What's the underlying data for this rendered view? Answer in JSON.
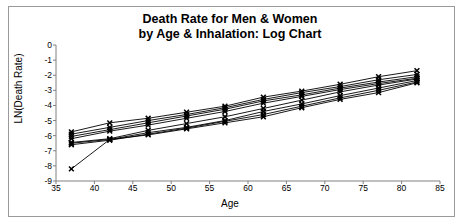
{
  "chart_data": {
    "type": "line",
    "title": "Death Rate for Men & Women by Age & Inhalation: Log Chart",
    "title_line1": "Death Rate for Men & Women",
    "title_line2": "by Age & Inhalation: Log Chart",
    "xlabel": "Age",
    "ylabel": "LN(Death Rate)",
    "xlim": [
      35,
      85
    ],
    "ylim": [
      -9,
      0
    ],
    "xticks": [
      35,
      40,
      45,
      50,
      55,
      60,
      65,
      70,
      75,
      80,
      85
    ],
    "yticks": [
      0,
      -1,
      -2,
      -3,
      -4,
      -5,
      -6,
      -7,
      -8,
      -9
    ],
    "grid": false,
    "legend": "none",
    "marker": "x-cross",
    "line_color": "#000000",
    "x": [
      37,
      42,
      47,
      52,
      57,
      62,
      67,
      72,
      77,
      82
    ],
    "series": [
      {
        "name": "series-1",
        "values": [
          -5.75,
          -5.15,
          -4.85,
          -4.45,
          -4.05,
          -3.45,
          -3.05,
          -2.6,
          -2.1,
          -1.7
        ]
      },
      {
        "name": "series-2",
        "values": [
          -5.9,
          -5.45,
          -5.0,
          -4.6,
          -4.15,
          -3.6,
          -3.15,
          -2.75,
          -2.3,
          -1.95
        ]
      },
      {
        "name": "series-3",
        "values": [
          -6.05,
          -5.6,
          -5.15,
          -4.7,
          -4.25,
          -3.7,
          -3.3,
          -2.85,
          -2.45,
          -2.1
        ]
      },
      {
        "name": "series-4",
        "values": [
          -6.2,
          -5.7,
          -5.3,
          -4.85,
          -4.4,
          -3.85,
          -3.4,
          -2.95,
          -2.55,
          -2.2
        ]
      },
      {
        "name": "series-5",
        "values": [
          -6.45,
          -6.2,
          -5.65,
          -5.2,
          -4.75,
          -4.2,
          -3.65,
          -3.1,
          -2.65,
          -2.25
        ]
      },
      {
        "name": "series-6",
        "values": [
          -6.5,
          -6.25,
          -5.8,
          -5.45,
          -5.0,
          -4.4,
          -3.9,
          -3.35,
          -2.85,
          -2.35
        ]
      },
      {
        "name": "series-7",
        "values": [
          -6.6,
          -6.3,
          -5.9,
          -5.5,
          -5.05,
          -4.6,
          -4.05,
          -3.5,
          -3.0,
          -2.45
        ]
      },
      {
        "name": "series-8",
        "values": [
          -8.2,
          -6.25,
          -5.95,
          -5.55,
          -5.15,
          -4.75,
          -4.15,
          -3.6,
          -3.15,
          -2.5
        ]
      }
    ]
  }
}
